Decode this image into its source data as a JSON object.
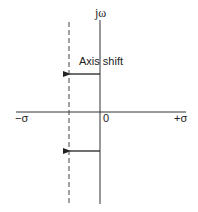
{
  "diagram": {
    "labels": {
      "vertical_axis": "jω",
      "negative_sigma": "−σ",
      "origin": "0",
      "positive_sigma": "+σ",
      "annotation": "Axis shift"
    },
    "colors": {
      "line": "#333333",
      "text": "#222222",
      "background": "#ffffff"
    }
  }
}
